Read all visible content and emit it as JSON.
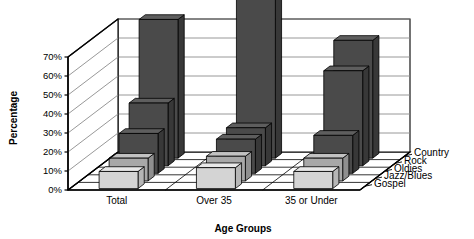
{
  "chart_data": {
    "type": "bar",
    "title": "",
    "subtitle": "",
    "xlabel": "Age Groups",
    "ylabel": "Percentage",
    "categories": [
      "Total",
      "Over 35",
      "35 or Under"
    ],
    "series": [
      {
        "name": "Gospel",
        "values": [
          9,
          11,
          9
        ],
        "color": "#d4d4d4"
      },
      {
        "name": "Jazz/Blues",
        "values": [
          12,
          13,
          12
        ],
        "color": "#a8a8a8"
      },
      {
        "name": "Oldies",
        "values": [
          21,
          18,
          20
        ],
        "color": "#555555"
      },
      {
        "name": "Rock",
        "values": [
          33,
          20,
          50
        ],
        "color": "#4a4a4a"
      },
      {
        "name": "Country",
        "values": [
          73,
          88,
          62
        ],
        "color": "#454545"
      }
    ],
    "ylim": [
      0,
      70
    ],
    "yticks": [
      0,
      10,
      20,
      30,
      40,
      50,
      60,
      70
    ],
    "ytick_labels": [
      "0%",
      "10%",
      "20%",
      "30%",
      "40%",
      "50%",
      "60%",
      "70%"
    ],
    "grid": true,
    "legend_position": "right-depth-axis",
    "projection": "3d",
    "legend_entries": [
      "Country",
      "Rock",
      "Oldies",
      "Jazz/Blues",
      "Gospel"
    ]
  },
  "colors": {
    "background": "#ffffff",
    "axis_line": "#000000",
    "gridline": "#8c8c8c",
    "floor": "#ffffff",
    "bar_light": "#d4d4d4",
    "bar_light_top": "#e8e8e8",
    "bar_light_side": "#b6b6b6",
    "bar_mid": "#a8a8a8",
    "bar_mid_top": "#c2c2c2",
    "bar_mid_side": "#8f8f8f",
    "bar_dark": "#4a4a4a",
    "bar_dark_top": "#5e5e5e",
    "bar_dark_side": "#383838",
    "text": "#000000"
  }
}
